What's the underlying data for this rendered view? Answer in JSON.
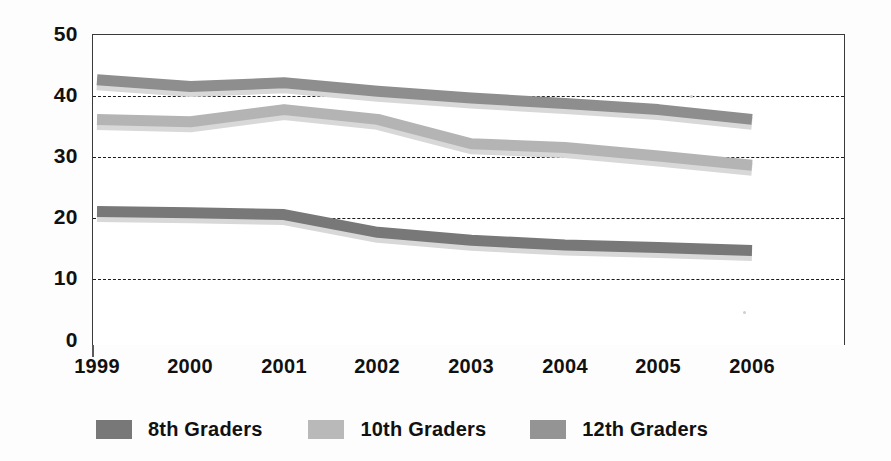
{
  "chart_data": {
    "type": "line",
    "title": "",
    "xlabel": "",
    "ylabel": "",
    "categories": [
      "1999",
      "2000",
      "2001",
      "2002",
      "2003",
      "2004",
      "2005",
      "2006"
    ],
    "x": [
      1999,
      2000,
      2001,
      2002,
      2003,
      2004,
      2005,
      2006
    ],
    "ylim": [
      0,
      50
    ],
    "yticks": [
      0,
      10,
      20,
      30,
      40,
      50
    ],
    "ytick_labels": [
      "0",
      "10",
      "20",
      "30",
      "40",
      "50"
    ],
    "grid": true,
    "grid_style": "dotted-horizontal",
    "grid_values": [
      10,
      20,
      30,
      40
    ],
    "legend_position": "bottom",
    "series": [
      {
        "name": "8th Graders",
        "color": "#787878",
        "values": [
          20.9,
          20.7,
          20.4,
          17.5,
          16.2,
          15.4,
          15.0,
          14.5
        ]
      },
      {
        "name": "10th Graders",
        "color": "#b4b4b4",
        "values": [
          36.0,
          35.6,
          37.6,
          36.0,
          32.0,
          31.4,
          30.0,
          28.5
        ]
      },
      {
        "name": "12th Graders",
        "color": "#8e8e8e",
        "values": [
          42.5,
          41.4,
          42.0,
          40.6,
          39.5,
          38.6,
          37.6,
          36.0
        ]
      }
    ]
  },
  "axes": {
    "y_ticks": [
      {
        "label": "50",
        "value": 50
      },
      {
        "label": "40",
        "value": 40
      },
      {
        "label": "30",
        "value": 30
      },
      {
        "label": "20",
        "value": 20
      },
      {
        "label": "10",
        "value": 10
      },
      {
        "label": "0",
        "value": 0
      }
    ],
    "x_ticks": [
      {
        "label": "1999"
      },
      {
        "label": "2000"
      },
      {
        "label": "2001"
      },
      {
        "label": "2002"
      },
      {
        "label": "2003"
      },
      {
        "label": "2004"
      },
      {
        "label": "2005"
      },
      {
        "label": "2006"
      }
    ]
  },
  "legend": {
    "items": [
      {
        "label": "8th Graders",
        "color": "#787878"
      },
      {
        "label": "10th Graders",
        "color": "#b4b4b4"
      },
      {
        "label": "12th Graders",
        "color": "#8e8e8e"
      }
    ]
  },
  "colors": {
    "axis": "#3a3a3a",
    "grid": "#1b1b1b",
    "text": "#111111",
    "background": "#ffffff",
    "series_8th": "#787878",
    "series_10th": "#b4b4b4",
    "series_12th": "#8e8e8e",
    "series_shadow": "#d8d8d8"
  }
}
